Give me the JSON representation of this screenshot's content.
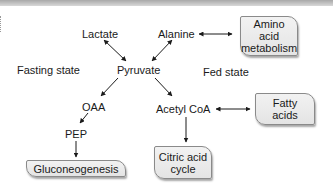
{
  "diagram": {
    "nodes": {
      "lactate": "Lactate",
      "alanine": "Alanine",
      "pyruvate": "Pyruvate",
      "oaa": "OAA",
      "pep": "PEP",
      "acetyl_coa": "Acetyl CoA"
    },
    "state_labels": {
      "fasting": "Fasting state",
      "fed": "Fed state"
    },
    "boxes": {
      "amino_acid": [
        "Amino",
        "acid",
        "metabolism"
      ],
      "fatty_acids": [
        "Fatty",
        "acids"
      ],
      "citric_acid": [
        "Citric acid",
        "cycle"
      ],
      "gluconeogenesis": [
        "Gluconeogenesis"
      ]
    },
    "edges": [
      {
        "from": "Lactate",
        "to": "Pyruvate",
        "type": "bidirectional"
      },
      {
        "from": "Alanine",
        "to": "Pyruvate",
        "type": "bidirectional"
      },
      {
        "from": "Alanine",
        "to": "Amino acid metabolism",
        "type": "bidirectional"
      },
      {
        "from": "Pyruvate",
        "to": "OAA",
        "type": "directed"
      },
      {
        "from": "Pyruvate",
        "to": "Acetyl CoA",
        "type": "directed"
      },
      {
        "from": "OAA",
        "to": "PEP",
        "type": "directed"
      },
      {
        "from": "PEP",
        "to": "Gluconeogenesis",
        "type": "directed"
      },
      {
        "from": "Acetyl CoA",
        "to": "Fatty acids",
        "type": "bidirectional"
      },
      {
        "from": "Acetyl CoA",
        "to": "Citric acid cycle",
        "type": "directed"
      }
    ]
  }
}
